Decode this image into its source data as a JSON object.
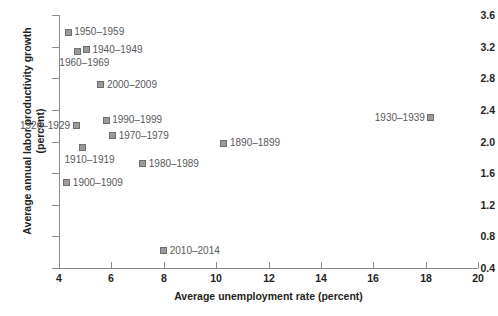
{
  "chart_data": {
    "type": "scatter",
    "title": "",
    "xlabel": "Average unemployment rate (percent)",
    "ylabel": "Average annual labor productivity growth (percent)",
    "xlim": [
      4,
      20
    ],
    "ylim": [
      0.4,
      3.6
    ],
    "xticks": [
      "4",
      "6",
      "8",
      "10",
      "12",
      "14",
      "16",
      "18",
      "20"
    ],
    "yticks": [
      "0.4",
      "0.8",
      "1.2",
      "1.6",
      "2.0",
      "2.4",
      "2.8",
      "3.2",
      "3.6"
    ],
    "grid": false,
    "legend": "none",
    "marker_color": "#9a9a9a",
    "marker_edge_color": "#6e6e6e",
    "label_color": "#58595b",
    "axis_color": "#8a8a8a",
    "points": [
      {
        "label": "1890–1899",
        "x": 10.3,
        "y": 1.98,
        "label_side": "right"
      },
      {
        "label": "1900–1909",
        "x": 4.3,
        "y": 1.48,
        "label_side": "right"
      },
      {
        "label": "1910–1919",
        "x": 4.9,
        "y": 1.92,
        "label_side": "below"
      },
      {
        "label": "1920–1929",
        "x": 4.65,
        "y": 2.2,
        "label_side": "left"
      },
      {
        "label": "1930–1939",
        "x": 18.2,
        "y": 2.3,
        "label_side": "left"
      },
      {
        "label": "1940–1949",
        "x": 5.05,
        "y": 3.16,
        "label_side": "right"
      },
      {
        "label": "1950–1959",
        "x": 4.35,
        "y": 3.38,
        "label_side": "right"
      },
      {
        "label": "1960–1969",
        "x": 4.7,
        "y": 3.14,
        "label_side": "below"
      },
      {
        "label": "1970–1979",
        "x": 6.05,
        "y": 2.07,
        "label_side": "right"
      },
      {
        "label": "1980–1989",
        "x": 7.2,
        "y": 1.72,
        "label_side": "right"
      },
      {
        "label": "1990–1999",
        "x": 5.8,
        "y": 2.27,
        "label_side": "right"
      },
      {
        "label": "2000–2009",
        "x": 5.6,
        "y": 2.72,
        "label_side": "right"
      },
      {
        "label": "2010–2014",
        "x": 8.0,
        "y": 0.62,
        "label_side": "right"
      }
    ]
  }
}
